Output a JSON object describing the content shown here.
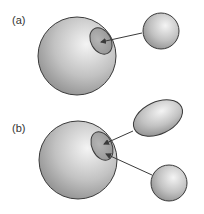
{
  "panels": [
    {
      "label": "(a)",
      "description": "Small sphere binding to a patch on a large sphere"
    },
    {
      "label": "(b)",
      "description": "Ellipsoid and small sphere both binding to a patch on a large sphere"
    }
  ],
  "colors": {
    "outline": "#3a3a3a",
    "sphere_light": "#f2f2f2",
    "sphere_dark": "#8c8c8c",
    "arrow": "#3a3a3a"
  }
}
